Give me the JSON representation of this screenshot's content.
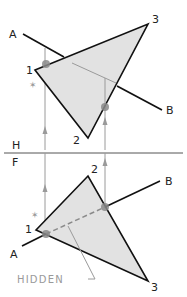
{
  "views": {
    "top": {
      "label": "H",
      "vertex_labels": {
        "v1": "1",
        "v2": "2",
        "v3": "3"
      },
      "line_labels": {
        "a": "A",
        "b": "B"
      }
    },
    "front": {
      "label": "F",
      "vertex_labels": {
        "v1": "1",
        "v2": "2",
        "v3": "3"
      },
      "line_labels": {
        "a": "A",
        "b": "B"
      },
      "hidden_label": "HIDDEN"
    }
  },
  "colors": {
    "plane_fill": "#e2e2e2",
    "edge": "#111111",
    "construction": "#9a9a9a",
    "point": "#8a8a8a"
  }
}
